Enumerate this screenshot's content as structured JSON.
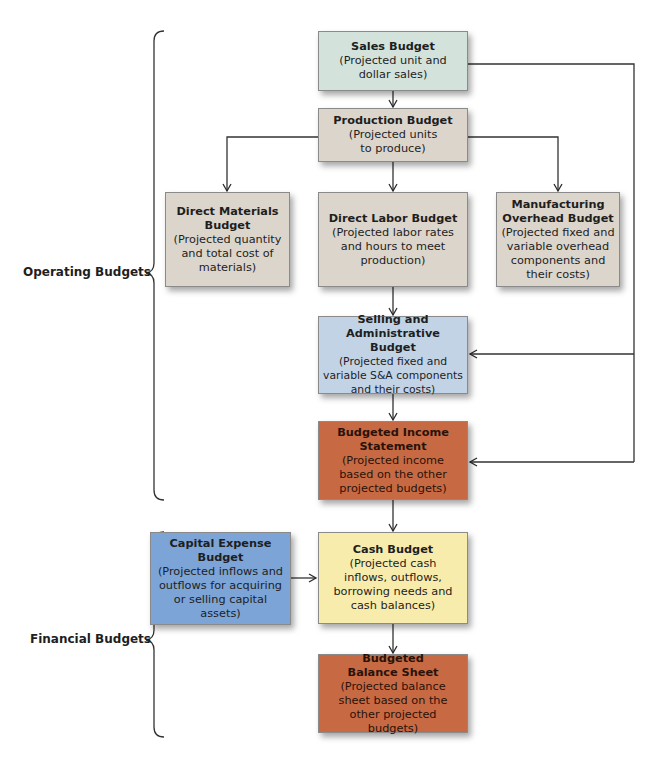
{
  "groups": {
    "operating": "Operating Budgets",
    "financial": "Financial Budgets"
  },
  "boxes": {
    "sales": {
      "title": "Sales Budget",
      "desc": "(Projected unit and dollar sales)",
      "color": "#d3e3dc"
    },
    "production": {
      "title": "Production Budget",
      "desc": "(Projected units to produce)",
      "color": "#dcd5cc"
    },
    "direct_materials": {
      "title": "Direct Materials Budget",
      "desc": "(Projected quantity and total cost of materials)",
      "color": "#dcd5cc"
    },
    "direct_labor": {
      "title": "Direct Labor Budget",
      "desc": "(Projected labor rates and hours to meet production)",
      "color": "#dcd5cc"
    },
    "manufacturing_overhead": {
      "title": "Manufacturing Overhead Budget",
      "desc": "(Projected fixed and variable overhead components and their costs)",
      "color": "#dcd5cc"
    },
    "selling_admin": {
      "title": "Selling and Administrative Budget",
      "desc": "(Projected fixed and variable S&A components and their costs)",
      "color": "#c2d3e6"
    },
    "income_statement": {
      "title": "Budgeted Income Statement",
      "desc": "(Projected income based on the other projected budgets)",
      "color": "#c76a44"
    },
    "capital_expense": {
      "title": "Capital Expense Budget",
      "desc": "(Projected inflows and outflows for acquiring or selling capital assets)",
      "color": "#7ca4d6"
    },
    "cash": {
      "title": "Cash Budget",
      "desc": "(Projected cash inflows, outflows, borrowing needs and cash balances)",
      "color": "#f8ecad"
    },
    "balance_sheet": {
      "title": "Budgeted Balance Sheet",
      "desc": "(Projected balance sheet based on the other projected budgets)",
      "color": "#c76a44"
    }
  },
  "edges": [
    [
      "sales",
      "production"
    ],
    [
      "production",
      "direct_materials"
    ],
    [
      "production",
      "direct_labor"
    ],
    [
      "production",
      "manufacturing_overhead"
    ],
    [
      "direct_labor",
      "selling_admin"
    ],
    [
      "sales",
      "selling_admin"
    ],
    [
      "sales",
      "income_statement"
    ],
    [
      "selling_admin",
      "income_statement"
    ],
    [
      "income_statement",
      "cash"
    ],
    [
      "capital_expense",
      "cash"
    ],
    [
      "cash",
      "balance_sheet"
    ]
  ]
}
